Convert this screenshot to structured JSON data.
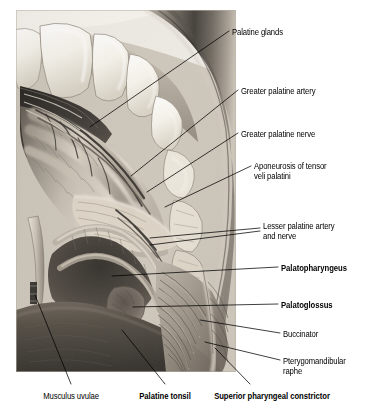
{
  "plate": {
    "kind": "anatomical-illustration",
    "subject": "Soft palate and oral cavity dissection, inferior view",
    "panel_width_px": 220,
    "panel_height_px": 362,
    "palette": {
      "ink": "#000000",
      "page": "#ffffff",
      "tissue_mid": "#a89e93",
      "tissue_light": "#e7e2db",
      "tooth_white": "#fbfaf6",
      "cheek_dark": "#3b3733",
      "shadow": "#2a2724"
    }
  },
  "labels": [
    {
      "id": "palatine-glands",
      "text": "Palatine glands",
      "bold": false,
      "align": "left",
      "x": 232,
      "y": 28
    },
    {
      "id": "greater-palatine-artery",
      "text": "Greater palatine artery",
      "bold": false,
      "align": "left",
      "x": 241,
      "y": 87
    },
    {
      "id": "greater-palatine-nerve",
      "text": "Greater palatine nerve",
      "bold": false,
      "align": "left",
      "x": 241,
      "y": 130
    },
    {
      "id": "aponeurosis-tensor-veli-palatini",
      "text": "Aponeurosis of tensor\nveli palatini",
      "bold": false,
      "align": "left",
      "x": 254,
      "y": 162
    },
    {
      "id": "lesser-palatine-artery-and-nerve",
      "text": "Lesser palatine artery\nand nerve",
      "bold": false,
      "align": "left",
      "x": 263,
      "y": 222
    },
    {
      "id": "palatopharyngeus",
      "text": "Palatopharyngeus",
      "bold": true,
      "align": "left",
      "x": 281,
      "y": 264
    },
    {
      "id": "palatoglossus",
      "text": "Palatoglossus",
      "bold": true,
      "align": "left",
      "x": 281,
      "y": 301
    },
    {
      "id": "buccinator",
      "text": "Buccinator",
      "bold": false,
      "align": "left",
      "x": 283,
      "y": 330
    },
    {
      "id": "pterygomandibular-raphe",
      "text": "Pterygomandibular\nraphe",
      "bold": false,
      "align": "left",
      "x": 283,
      "y": 357
    },
    {
      "id": "musculus-uvulae",
      "text": "Musculus uvulae",
      "bold": false,
      "align": "center",
      "x": 71,
      "y": 392
    },
    {
      "id": "palatine-tonsil",
      "text": "Palatine tonsil",
      "bold": true,
      "align": "center",
      "x": 165,
      "y": 392
    },
    {
      "id": "superior-pharyngeal-constrictor",
      "text": "Superior pharyngeal constrictor",
      "bold": true,
      "align": "center",
      "x": 272,
      "y": 392
    }
  ],
  "leader_lines": [
    {
      "id": "leader-palatine-glands",
      "points": "229,31 90,127"
    },
    {
      "id": "leader-greater-palatine-artery",
      "points": "238,90 131,176"
    },
    {
      "id": "leader-greater-palatine-nerve",
      "points": "238,133 147,192"
    },
    {
      "id": "leader-aponeurosis",
      "points": "251,166 165,207"
    },
    {
      "id": "leader-lesser-palatine-a",
      "points": "260,228 150,238"
    },
    {
      "id": "leader-lesser-palatine-b",
      "points": "260,231 150,245"
    },
    {
      "id": "leader-palatopharyngeus",
      "points": "278,267 112,276"
    },
    {
      "id": "leader-palatoglossus",
      "points": "278,304 133,307"
    },
    {
      "id": "leader-buccinator",
      "points": "280,333 200,320"
    },
    {
      "id": "leader-pterygomandibular-raphe",
      "points": "280,360 205,342"
    },
    {
      "id": "leader-musculus-uvulae",
      "points": "71,384 35,295"
    },
    {
      "id": "leader-palatine-tonsil",
      "points": "165,384 122,330"
    },
    {
      "id": "leader-superior-pharyngeal-constrictor",
      "points": "250,384 215,348"
    }
  ]
}
